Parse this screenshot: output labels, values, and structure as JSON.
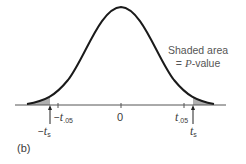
{
  "figure": {
    "panel_label": "(b)",
    "annotation_line1": "Shaded area",
    "annotation_line2_prefix": "= ",
    "annotation_line2_italic": "P",
    "annotation_line2_suffix": "-value",
    "center_label": "0",
    "neg_crit": {
      "prefix": "−",
      "var": "t",
      "sub": ".05"
    },
    "pos_crit": {
      "var": "t",
      "sub": ".05"
    },
    "neg_stat": {
      "prefix": "−",
      "var": "t",
      "sub": "s"
    },
    "pos_stat": {
      "var": "t",
      "sub": "s"
    },
    "colors": {
      "curve": "#1a1a1a",
      "shade": "#b0b0b0",
      "axis": "#555555"
    }
  }
}
